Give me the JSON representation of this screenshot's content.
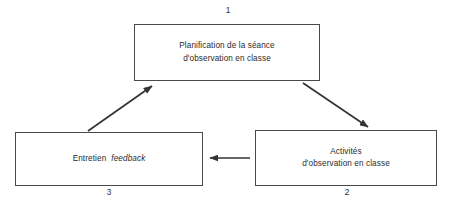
{
  "diagram": {
    "type": "cycle-flow",
    "title_visible": false,
    "colors": {
      "box_border": "#4a4a4a",
      "text": "#2b2b2b",
      "arrow": "#333333",
      "background": "#ffffff"
    },
    "nodes": [
      {
        "id": "node-1",
        "number": "1",
        "number_position": "above",
        "lines": [
          "Planification de la séance",
          "d'observation en classe"
        ],
        "italic_lines": [],
        "box": {
          "x": 134,
          "y": 24,
          "width": 186,
          "height": 57
        }
      },
      {
        "id": "node-2",
        "number": "2",
        "number_position": "below",
        "lines": [
          "Activités",
          "d'observation en classe"
        ],
        "italic_lines": [],
        "box": {
          "x": 255,
          "y": 130,
          "width": 182,
          "height": 56
        }
      },
      {
        "id": "node-3",
        "number": "3",
        "number_position": "below",
        "lines": [
          "Entretien",
          "feedback"
        ],
        "italic_lines": [
          "feedback"
        ],
        "inline": true,
        "box": {
          "x": 15,
          "y": 132,
          "width": 188,
          "height": 54
        }
      }
    ],
    "edges": [
      {
        "id": "edge-1-to-2",
        "from": "node-1",
        "to": "node-2",
        "direction": "down-right",
        "style": "solid-arrow"
      },
      {
        "id": "edge-2-to-3",
        "from": "node-2",
        "to": "node-3",
        "direction": "left",
        "style": "solid-arrow"
      },
      {
        "id": "edge-3-to-1",
        "from": "node-3",
        "to": "node-1",
        "direction": "up-right",
        "style": "solid-arrow"
      }
    ]
  }
}
